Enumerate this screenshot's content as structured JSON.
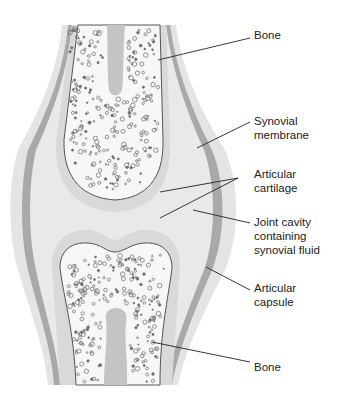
{
  "diagram": {
    "colors": {
      "outer_tissue": "#e4e4e4",
      "capsule_band": "#a9a9a9",
      "cavity": "#e9e9e9",
      "cartilage": "#d9d9d9",
      "bone_fill": "#f7f7f5",
      "marrow_canal": "#c4c4c4",
      "outline": "#555555",
      "leader_line": "#222222"
    },
    "labels": [
      {
        "id": "bone-top",
        "lines": [
          "Bone"
        ],
        "x": 254,
        "y": 28
      },
      {
        "id": "synovial-membrane",
        "lines": [
          "Synovial",
          "membrane"
        ],
        "x": 254,
        "y": 114
      },
      {
        "id": "articular-cartilage",
        "lines": [
          "Articular",
          "cartilage"
        ],
        "x": 254,
        "y": 167
      },
      {
        "id": "joint-cavity",
        "lines": [
          "Joint cavity",
          "containing",
          "synovial fluid"
        ],
        "x": 254,
        "y": 215
      },
      {
        "id": "articular-capsule",
        "lines": [
          "Articular",
          "capsule"
        ],
        "x": 254,
        "y": 281
      },
      {
        "id": "bone-bottom",
        "lines": [
          "Bone"
        ],
        "x": 254,
        "y": 360
      }
    ]
  }
}
